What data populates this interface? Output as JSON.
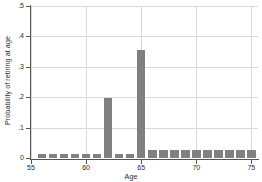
{
  "chart_data": {
    "type": "bar",
    "title": "",
    "subtitle": "",
    "xlabel": "Age",
    "ylabel": "Probability of retiring at age",
    "xlim": [
      55,
      75.6
    ],
    "ylim": [
      0,
      0.5
    ],
    "grid": true,
    "legend": null,
    "bar_color": "#808080",
    "grid_color": "#d8d8d8",
    "axis_color": "#55565a",
    "background_color": "#ffffff",
    "xticks": [
      55,
      60,
      65,
      70,
      75
    ],
    "xtick_labels": [
      "55",
      "60",
      "65",
      "70",
      "75"
    ],
    "yticks": [
      0,
      0.1,
      0.2,
      0.3,
      0.4,
      0.5
    ],
    "ytick_labels": [
      "0",
      ".1",
      ".2",
      ".3",
      ".4",
      ".5"
    ],
    "categories": [
      56,
      57,
      58,
      59,
      60,
      61,
      62,
      63,
      64,
      65,
      66,
      67,
      68,
      69,
      70,
      71,
      72,
      73,
      74,
      75
    ],
    "values": [
      0.013,
      0.013,
      0.013,
      0.013,
      0.013,
      0.013,
      0.197,
      0.013,
      0.013,
      0.355,
      0.026,
      0.026,
      0.026,
      0.026,
      0.026,
      0.026,
      0.026,
      0.026,
      0.026,
      0.026
    ]
  }
}
